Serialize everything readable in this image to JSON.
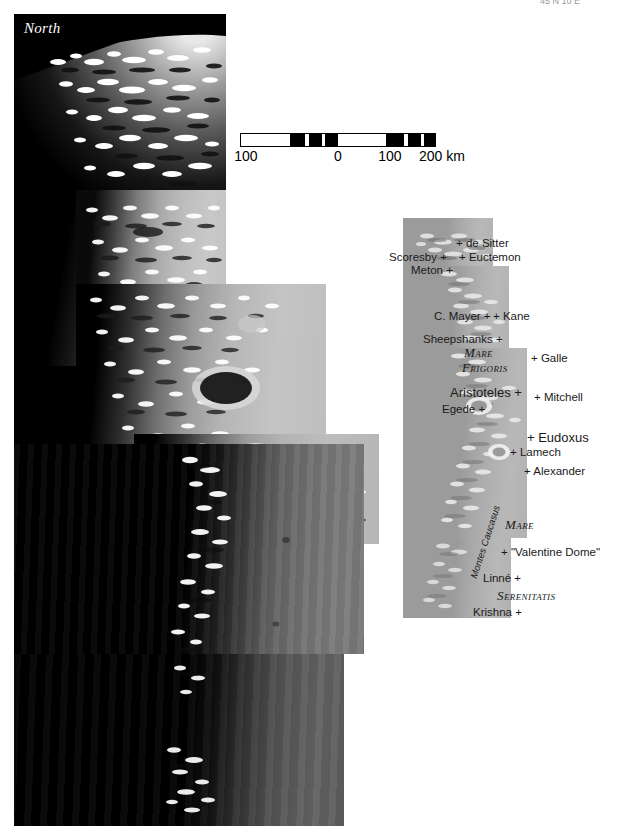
{
  "figure": {
    "orientation_label": "North",
    "top_cut_text": "45 N 10 E",
    "kind": "lunar-terminator-mosaic-with-reference-map"
  },
  "scale_bar": {
    "unit_label": "km",
    "ticks": [
      "100",
      "0",
      "100",
      "200 km"
    ],
    "segments": [
      {
        "fill": "#ffffff",
        "width_pct": 25
      },
      {
        "fill": "#000000",
        "width_pct": 8
      },
      {
        "fill": "#ffffff",
        "width_pct": 2
      },
      {
        "fill": "#000000",
        "width_pct": 7
      },
      {
        "fill": "#ffffff",
        "width_pct": 1.5
      },
      {
        "fill": "#000000",
        "width_pct": 6.5
      },
      {
        "fill": "#ffffff",
        "width_pct": 25
      },
      {
        "fill": "#000000",
        "width_pct": 9
      },
      {
        "fill": "#ffffff",
        "width_pct": 2
      },
      {
        "fill": "#000000",
        "width_pct": 7
      },
      {
        "fill": "#ffffff",
        "width_pct": 1.5
      },
      {
        "fill": "#000000",
        "width_pct": 5.5
      }
    ]
  },
  "inset_map": {
    "title": "reference map",
    "background_color": "#a8a8a8",
    "features": [
      {
        "name": "de Sitter",
        "label": "+ de Sitter",
        "x": 456,
        "y": 238,
        "size": "med",
        "style": "crater"
      },
      {
        "name": "Scoresby",
        "label": "Scoresby +",
        "x": 389,
        "y": 252,
        "size": "med",
        "style": "crater"
      },
      {
        "name": "Euctemon",
        "label": "+ Euctemon",
        "x": 459,
        "y": 252,
        "size": "med",
        "style": "crater"
      },
      {
        "name": "Meton",
        "label": "Meton +",
        "x": 411,
        "y": 265,
        "size": "med",
        "style": "crater"
      },
      {
        "name": "C. Mayer",
        "label": "C. Mayer +",
        "x": 434,
        "y": 311,
        "size": "med",
        "style": "crater"
      },
      {
        "name": "Kane",
        "label": "+ Kane",
        "x": 493,
        "y": 311,
        "size": "med",
        "style": "crater"
      },
      {
        "name": "Sheepshanks",
        "label": "Sheepshanks +",
        "x": 423,
        "y": 334,
        "size": "med",
        "style": "crater"
      },
      {
        "name": "Mare Frigoris",
        "label": "Mare",
        "x": 464,
        "y": 346,
        "size": "mare",
        "style": "mare"
      },
      {
        "name": "Mare Frigoris 2",
        "label": "Frigoris",
        "x": 462,
        "y": 361,
        "size": "mare",
        "style": "mare"
      },
      {
        "name": "Galle",
        "label": "+ Galle",
        "x": 531,
        "y": 353,
        "size": "med",
        "style": "crater"
      },
      {
        "name": "Aristoteles",
        "label": "Aristoteles +",
        "x": 450,
        "y": 386,
        "size": "big",
        "style": "crater"
      },
      {
        "name": "Mitchell",
        "label": "+ Mitchell",
        "x": 534,
        "y": 392,
        "size": "med",
        "style": "crater"
      },
      {
        "name": "Egede",
        "label": "Egede +",
        "x": 442,
        "y": 404,
        "size": "med",
        "style": "crater"
      },
      {
        "name": "Eudoxus",
        "label": "+ Eudoxus",
        "x": 527,
        "y": 431,
        "size": "big",
        "style": "crater"
      },
      {
        "name": "Lamech",
        "label": "+ Lamech",
        "x": 510,
        "y": 447,
        "size": "med",
        "style": "crater"
      },
      {
        "name": "Alexander",
        "label": "+ Alexander",
        "x": 524,
        "y": 466,
        "size": "med",
        "style": "crater"
      },
      {
        "name": "Montes Caucasus",
        "label": "Montes Caucasus",
        "x": 478,
        "y": 570,
        "size": "rot",
        "style": "range"
      },
      {
        "name": "Mare Serenitatis",
        "label": "Mare",
        "x": 505,
        "y": 518,
        "size": "mare",
        "style": "mare"
      },
      {
        "name": "Valentine Dome",
        "label": "+ \"Valentine Dome\"",
        "x": 501,
        "y": 547,
        "size": "med",
        "style": "dome"
      },
      {
        "name": "Linne",
        "label": "Linné +",
        "x": 483,
        "y": 573,
        "size": "med",
        "style": "crater"
      },
      {
        "name": "Serenitatis",
        "label": "Serenitatis",
        "x": 497,
        "y": 589,
        "size": "mare",
        "style": "mare"
      },
      {
        "name": "Krishna",
        "label": "Krishna +",
        "x": 473,
        "y": 607,
        "size": "med",
        "style": "crater"
      }
    ]
  },
  "mosaic": {
    "sky_color": "#000000",
    "tile_count": 7,
    "description": "overlapping image strips across the lunar terminator"
  }
}
